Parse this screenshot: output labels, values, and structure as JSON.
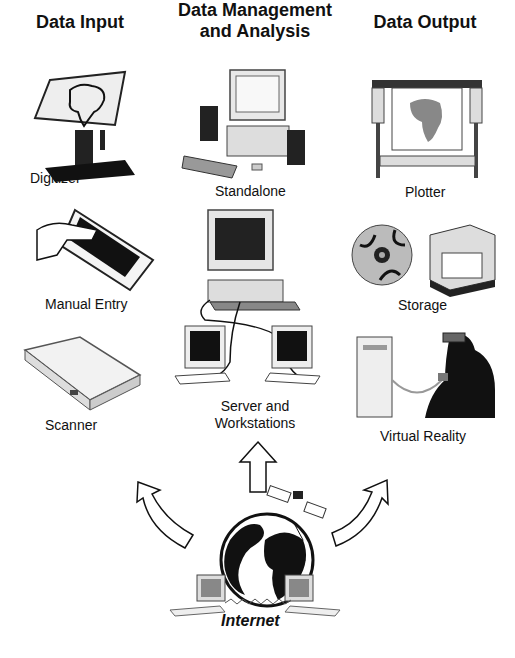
{
  "diagram": {
    "columns": [
      {
        "title": "Data Input",
        "items": [
          "Digitizer",
          "Manual Entry",
          "Scanner"
        ]
      },
      {
        "title_line1": "Data Management",
        "title_line2": "and Analysis",
        "items": [
          "Standalone",
          "Server and",
          "Workstations"
        ]
      },
      {
        "title": "Data Output",
        "items": [
          "Plotter",
          "Storage",
          "Virtual Reality"
        ]
      }
    ],
    "source": {
      "label": "Internet"
    },
    "arrows": [
      "to-data-input",
      "to-data-management",
      "to-data-output"
    ]
  }
}
